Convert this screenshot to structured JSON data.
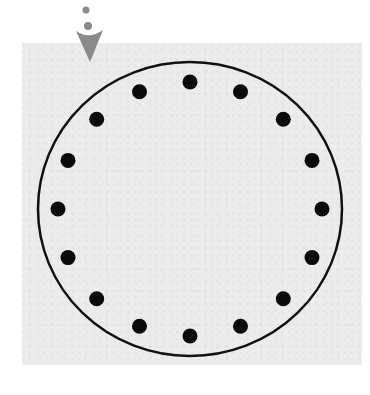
{
  "diagram": {
    "dot_count": 16,
    "colors": {
      "panel": "#ececec",
      "circle_stroke": "#111111",
      "dot_fill": "#0a0a0a",
      "arrow": "#8a8a8a"
    },
    "marker": {
      "icon": "down-arrow-with-dots-icon",
      "meaning": "start position indicator"
    }
  }
}
